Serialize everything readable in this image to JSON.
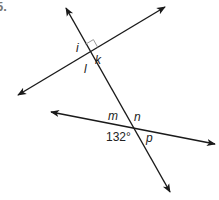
{
  "problem": {
    "number": "5."
  },
  "diagram": {
    "line_color": "#1a1a1a",
    "right_angle_color": "#999999",
    "labels": {
      "i": "i",
      "k": "k",
      "l": "l",
      "m": "m",
      "n": "n",
      "p": "p",
      "angle_given": "132°"
    },
    "points": {
      "intersection_upper": [
        90,
        52
      ],
      "intersection_lower": [
        133,
        127
      ]
    },
    "lines": [
      {
        "name": "transversal",
        "from": [
          66,
          8
        ],
        "to": [
          170,
          192
        ]
      },
      {
        "name": "upper-line",
        "from": [
          18,
          95
        ],
        "to": [
          165,
          7
        ]
      },
      {
        "name": "lower-line",
        "from": [
          51,
          112
        ],
        "to": [
          215,
          144
        ]
      }
    ]
  }
}
